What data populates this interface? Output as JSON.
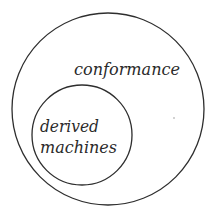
{
  "diagram": {
    "type": "nested-set (Euler/Venn) diagram",
    "outer_set": {
      "label": "conformance",
      "shape": "circle",
      "stroke_color": "#2e2e2e"
    },
    "inner_set": {
      "label_line1": "derived",
      "label_line2": "machines",
      "shape": "circle",
      "stroke_color": "#2e2e2e"
    },
    "relationship": "derived machines is a subset of conformance"
  }
}
